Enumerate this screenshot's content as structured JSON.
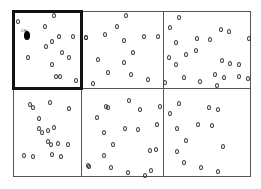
{
  "diagram": {
    "type": "grid-of-quadrats-with-points",
    "rows": 2,
    "columns": 3,
    "highlighted_cell": {
      "row": 0,
      "col": 0
    },
    "colors": {
      "grid_line": "#555555",
      "highlight_border": "#111111",
      "point_outline": "#333333",
      "filled_point": "#000000",
      "background": "#ffffff"
    },
    "grid": {
      "left": 13,
      "top": 11,
      "right": 250,
      "bottom": 176,
      "col_dividers": [
        81,
        163
      ],
      "row_dividers": [
        88
      ]
    },
    "labels": [
      {
        "text": "CH",
        "x": 21,
        "y": 29
      }
    ],
    "corner_mark": {
      "text": "'",
      "x": 9,
      "y": 180
    },
    "filled_points": [
      {
        "x": 27,
        "y": 35
      }
    ],
    "points": [
      {
        "x": 18,
        "y": 21
      },
      {
        "x": 54,
        "y": 15
      },
      {
        "x": 45,
        "y": 26
      },
      {
        "x": 59,
        "y": 36
      },
      {
        "x": 73,
        "y": 36
      },
      {
        "x": 52,
        "y": 41
      },
      {
        "x": 46,
        "y": 46
      },
      {
        "x": 62,
        "y": 52
      },
      {
        "x": 69,
        "y": 57
      },
      {
        "x": 28,
        "y": 57
      },
      {
        "x": 52,
        "y": 64
      },
      {
        "x": 56,
        "y": 76
      },
      {
        "x": 60,
        "y": 76
      },
      {
        "x": 76,
        "y": 80
      },
      {
        "x": 86,
        "y": 37
      },
      {
        "x": 126,
        "y": 15
      },
      {
        "x": 117,
        "y": 26
      },
      {
        "x": 86,
        "y": 37
      },
      {
        "x": 105,
        "y": 34
      },
      {
        "x": 124,
        "y": 40
      },
      {
        "x": 144,
        "y": 36
      },
      {
        "x": 158,
        "y": 36
      },
      {
        "x": 133,
        "y": 52
      },
      {
        "x": 98,
        "y": 59
      },
      {
        "x": 124,
        "y": 62
      },
      {
        "x": 108,
        "y": 72
      },
      {
        "x": 131,
        "y": 74
      },
      {
        "x": 148,
        "y": 79
      },
      {
        "x": 93,
        "y": 83
      },
      {
        "x": 165,
        "y": 82
      },
      {
        "x": 179,
        "y": 17
      },
      {
        "x": 170,
        "y": 27
      },
      {
        "x": 221,
        "y": 29
      },
      {
        "x": 229,
        "y": 31
      },
      {
        "x": 176,
        "y": 42
      },
      {
        "x": 197,
        "y": 38
      },
      {
        "x": 210,
        "y": 39
      },
      {
        "x": 186,
        "y": 54
      },
      {
        "x": 196,
        "y": 50
      },
      {
        "x": 169,
        "y": 57
      },
      {
        "x": 176,
        "y": 64
      },
      {
        "x": 222,
        "y": 60
      },
      {
        "x": 230,
        "y": 63
      },
      {
        "x": 239,
        "y": 64
      },
      {
        "x": 184,
        "y": 77
      },
      {
        "x": 200,
        "y": 81
      },
      {
        "x": 215,
        "y": 74
      },
      {
        "x": 224,
        "y": 77
      },
      {
        "x": 239,
        "y": 76
      },
      {
        "x": 248,
        "y": 78
      },
      {
        "x": 217,
        "y": 85
      },
      {
        "x": 249,
        "y": 38
      },
      {
        "x": 30,
        "y": 104
      },
      {
        "x": 33,
        "y": 107
      },
      {
        "x": 50,
        "y": 102
      },
      {
        "x": 69,
        "y": 108
      },
      {
        "x": 39,
        "y": 118
      },
      {
        "x": 39,
        "y": 128
      },
      {
        "x": 42,
        "y": 132
      },
      {
        "x": 48,
        "y": 130
      },
      {
        "x": 54,
        "y": 127
      },
      {
        "x": 48,
        "y": 141
      },
      {
        "x": 51,
        "y": 144
      },
      {
        "x": 58,
        "y": 143
      },
      {
        "x": 68,
        "y": 144
      },
      {
        "x": 24,
        "y": 155
      },
      {
        "x": 33,
        "y": 156
      },
      {
        "x": 52,
        "y": 154
      },
      {
        "x": 61,
        "y": 156
      },
      {
        "x": 88,
        "y": 165
      },
      {
        "x": 129,
        "y": 100
      },
      {
        "x": 106,
        "y": 106
      },
      {
        "x": 108,
        "y": 107
      },
      {
        "x": 140,
        "y": 109
      },
      {
        "x": 160,
        "y": 106
      },
      {
        "x": 97,
        "y": 117
      },
      {
        "x": 104,
        "y": 132
      },
      {
        "x": 125,
        "y": 128
      },
      {
        "x": 138,
        "y": 129
      },
      {
        "x": 157,
        "y": 124
      },
      {
        "x": 113,
        "y": 144
      },
      {
        "x": 150,
        "y": 150
      },
      {
        "x": 156,
        "y": 149
      },
      {
        "x": 104,
        "y": 155
      },
      {
        "x": 89,
        "y": 166
      },
      {
        "x": 111,
        "y": 167
      },
      {
        "x": 128,
        "y": 172
      },
      {
        "x": 151,
        "y": 170
      },
      {
        "x": 145,
        "y": 175
      },
      {
        "x": 179,
        "y": 103
      },
      {
        "x": 170,
        "y": 113
      },
      {
        "x": 209,
        "y": 107
      },
      {
        "x": 218,
        "y": 109
      },
      {
        "x": 177,
        "y": 128
      },
      {
        "x": 198,
        "y": 124
      },
      {
        "x": 212,
        "y": 125
      },
      {
        "x": 186,
        "y": 140
      },
      {
        "x": 223,
        "y": 146
      },
      {
        "x": 177,
        "y": 151
      },
      {
        "x": 184,
        "y": 162
      },
      {
        "x": 201,
        "y": 167
      },
      {
        "x": 218,
        "y": 171
      }
    ]
  }
}
